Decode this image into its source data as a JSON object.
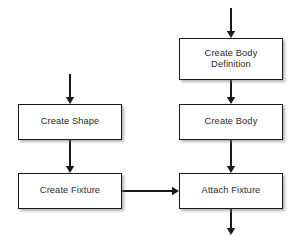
{
  "diagram": {
    "background_color": "#ffffff",
    "node_fill": "#ffffff",
    "node_border_color": "#1a1a1a",
    "text_color": "#2b2b2b",
    "arrow_color": "#1a1a1a",
    "nodes": [
      {
        "id": "create-body-definition",
        "label": "Create Body\nDefinition",
        "x": 179,
        "y": 38,
        "width": 104,
        "height": 42
      },
      {
        "id": "create-shape",
        "label": "Create Shape",
        "x": 18,
        "y": 104,
        "width": 104,
        "height": 36
      },
      {
        "id": "create-body",
        "label": "Create Body",
        "x": 179,
        "y": 104,
        "width": 104,
        "height": 36
      },
      {
        "id": "create-fixture",
        "label": "Create Fixture",
        "x": 18,
        "y": 173,
        "width": 104,
        "height": 36
      },
      {
        "id": "attach-fixture",
        "label": "Attach Fixture",
        "x": 179,
        "y": 173,
        "width": 104,
        "height": 36
      }
    ],
    "edges": [
      {
        "id": "entry-to-create-body-definition",
        "from": "start",
        "to": "create-body-definition",
        "orientation": "vertical",
        "x1": 231,
        "y1": 8,
        "x2": 231,
        "y2": 38
      },
      {
        "id": "create-body-definition-to-create-body",
        "from": "create-body-definition",
        "to": "create-body",
        "orientation": "vertical",
        "x1": 231,
        "y1": 80,
        "x2": 231,
        "y2": 104
      },
      {
        "id": "entry-to-create-shape",
        "from": "start",
        "to": "create-shape",
        "orientation": "vertical",
        "x1": 70,
        "y1": 74,
        "x2": 70,
        "y2": 104
      },
      {
        "id": "create-shape-to-create-fixture",
        "from": "create-shape",
        "to": "create-fixture",
        "orientation": "vertical",
        "x1": 70,
        "y1": 140,
        "x2": 70,
        "y2": 173
      },
      {
        "id": "create-body-to-attach-fixture",
        "from": "create-body",
        "to": "attach-fixture",
        "orientation": "vertical",
        "x1": 231,
        "y1": 140,
        "x2": 231,
        "y2": 173
      },
      {
        "id": "create-fixture-to-attach-fixture",
        "from": "create-fixture",
        "to": "attach-fixture",
        "orientation": "horizontal",
        "x1": 122,
        "y1": 191,
        "x2": 179,
        "y2": 191
      },
      {
        "id": "attach-fixture-to-exit",
        "from": "attach-fixture",
        "to": "end",
        "orientation": "vertical",
        "x1": 231,
        "y1": 209,
        "x2": 231,
        "y2": 235
      }
    ]
  }
}
